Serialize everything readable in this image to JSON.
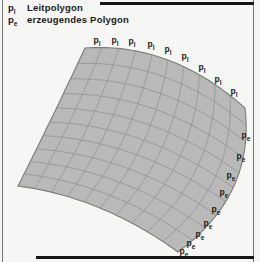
{
  "legend": {
    "items": [
      {
        "base": "p",
        "sub": "l",
        "label": "Leitpolygon"
      },
      {
        "base": "p",
        "sub": "e",
        "label": "erzeugendes Polygon"
      }
    ]
  },
  "diagram": {
    "surface": {
      "fill": "#b9b9b9",
      "grid_color": "#8d8d8d",
      "outline_color": "#7a7a7a",
      "columns": 10,
      "rows": 10,
      "corners": {
        "p00": [
          85,
          48
        ],
        "p10": [
          245,
          108
        ],
        "p01": [
          18,
          186
        ],
        "p11": [
          178,
          252
        ]
      },
      "edge_controls": {
        "top": [
          171,
          42
        ],
        "right": [
          255,
          195
        ],
        "bottom": [
          102,
          197
        ],
        "left": [
          48,
          127
        ]
      }
    },
    "point_labels": {
      "leitpolygon": {
        "base": "p",
        "sub": "l",
        "positions": [
          [
            97,
            41
          ],
          [
            115,
            41
          ],
          [
            132,
            42
          ],
          [
            151,
            45
          ],
          [
            168,
            50
          ],
          [
            185,
            57
          ],
          [
            202,
            68
          ],
          [
            218,
            80
          ],
          [
            234,
            92
          ]
        ]
      },
      "erzeugendes": {
        "base": "p",
        "sub": "e",
        "positions": [
          [
            246,
            136
          ],
          [
            241,
            157
          ],
          [
            231,
            176
          ],
          [
            224,
            193
          ],
          [
            216,
            210
          ],
          [
            208,
            224
          ],
          [
            200,
            235
          ],
          [
            191,
            244
          ],
          [
            184,
            252
          ]
        ]
      }
    }
  }
}
